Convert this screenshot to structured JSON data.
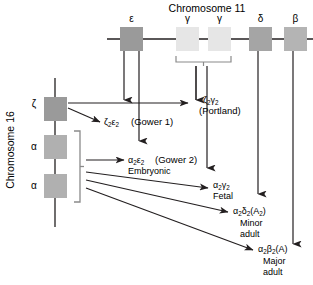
{
  "figure": {
    "chromosome11": {
      "title": "Chromosome 11",
      "genes": [
        {
          "label": "ε",
          "name": "epsilon"
        },
        {
          "label": "γ",
          "name": "gamma-g"
        },
        {
          "label": "γ",
          "name": "gamma-a"
        },
        {
          "label": "δ",
          "name": "delta"
        },
        {
          "label": "β",
          "name": "beta"
        }
      ]
    },
    "chromosome16": {
      "title": "Chromosome 16",
      "genes": [
        {
          "label": "ζ",
          "name": "zeta"
        },
        {
          "label": "α",
          "name": "alpha-2"
        },
        {
          "label": "α",
          "name": "alpha-1"
        }
      ]
    },
    "hemoglobins": [
      {
        "id": "gower1",
        "chains": "ζ",
        "chains_sub1": "2",
        "chains2": "ε",
        "chains_sub2": "2",
        "paren": "(Gower 1)",
        "stage": ""
      },
      {
        "id": "portland",
        "chains": "ζ",
        "chains_sub1": "2",
        "chains2": "γ",
        "chains_sub2": "2",
        "paren": "(Portland)",
        "stage": ""
      },
      {
        "id": "gower2",
        "chains": "α",
        "chains_sub1": "2",
        "chains2": "ε",
        "chains_sub2": "2",
        "paren": "(Gower 2)",
        "stage": "Embryonic"
      },
      {
        "id": "fetal",
        "chains": "α",
        "chains_sub1": "2",
        "chains2": "γ",
        "chains_sub2": "2",
        "paren": "",
        "stage": "Fetal"
      },
      {
        "id": "minor-adult",
        "chains": "α",
        "chains_sub1": "2",
        "chains2": "δ",
        "chains_sub2": "2",
        "paren": "(A",
        "paren_sub": "2",
        "paren_end": ")",
        "stage": "Minor",
        "stage2": "adult"
      },
      {
        "id": "major-adult",
        "chains": "α",
        "chains_sub1": "2",
        "chains2": "β",
        "chains_sub2": "2",
        "paren": "(A)",
        "stage": "Major",
        "stage2": "adult"
      }
    ],
    "colors": {
      "gene_dark": "#9a9a9a",
      "gene_light": "#e2e2e2",
      "gene_mid": "#b0b0b0",
      "line": "#231f20",
      "bracket": "#8a8a8a",
      "background": "#ffffff"
    }
  }
}
